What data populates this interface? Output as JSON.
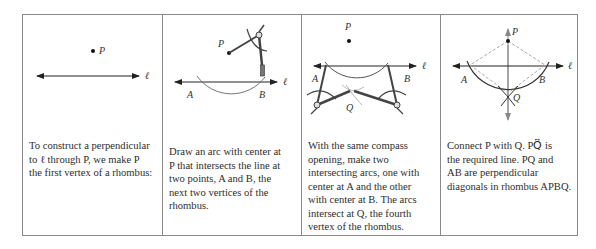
{
  "figure": {
    "panels": [
      {
        "id": "step-1",
        "labels": {
          "point_p": "P",
          "line": "ℓ"
        },
        "caption_lines": [
          "To construct a perpendicular",
          "to ℓ through  P,  we make P",
          "the first vertex of a rhombus:"
        ]
      },
      {
        "id": "step-2",
        "labels": {
          "point_p": "P",
          "point_a": "A",
          "point_b": "B",
          "line": "ℓ"
        },
        "caption_lines": [
          "Draw an arc with center at",
          "P that intersects the line at",
          "two points,  A and B, the",
          "next two vertices of the",
          "rhombus."
        ]
      },
      {
        "id": "step-3",
        "labels": {
          "point_p": "P",
          "point_a": "A",
          "point_b": "B",
          "point_q": "Q",
          "line": "ℓ"
        },
        "caption_lines": [
          "With the same compass",
          "opening, make two",
          "intersecting arcs, one with",
          "center at  A  and the other",
          "with center at  B. The arcs",
          "intersect at  Q, the fourth",
          "vertex of the rhombus."
        ]
      },
      {
        "id": "step-4",
        "labels": {
          "point_p": "P",
          "point_a": "A",
          "point_b": "B",
          "point_q": "Q",
          "line": "ℓ"
        },
        "caption_lines": [
          "Connect  P with Q. PQ⃡ is",
          "the required line.  PQ and",
          "AB are perpendicular",
          "diagonals in rhombus APBQ."
        ]
      }
    ],
    "colors": {
      "border": "#8a8a8a",
      "ink": "#2a2a2a",
      "dashed": "#a8a8a8",
      "arc": "#555555"
    }
  }
}
